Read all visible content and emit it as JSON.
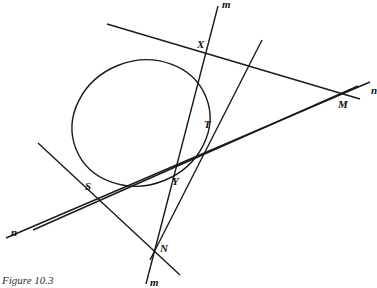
{
  "figure": {
    "caption": "Figure 10.3",
    "stroke_color": "#1a1a1a",
    "points": {
      "X": {
        "label": "X",
        "x": 193,
        "y": 48
      },
      "M": {
        "label": "M",
        "x": 345,
        "y": 93
      },
      "T": {
        "label": "T",
        "x": 209,
        "y": 131
      },
      "S": {
        "label": "S",
        "x": 82,
        "y": 196
      },
      "Y": {
        "label": "Y",
        "x": 170,
        "y": 172
      },
      "N": {
        "label": "N",
        "x": 155,
        "y": 247
      }
    },
    "line_labels": {
      "m_top": "m",
      "m_bottom": "m",
      "n_left": "n",
      "n_right": "n"
    },
    "conic": {
      "type": "ellipse",
      "cx": 141,
      "cy": 123,
      "rx": 70,
      "ry": 63,
      "rotation": -20
    }
  }
}
